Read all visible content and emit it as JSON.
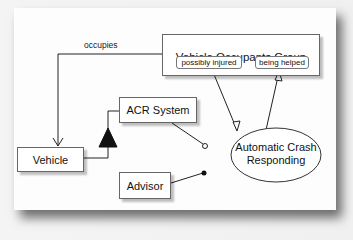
{
  "diagram": {
    "type": "uml-use-case",
    "nodes": {
      "vehicle_occupants_group": {
        "title": "Vehicle Occupants Group",
        "states": [
          "possibly injured",
          "being helped"
        ]
      },
      "acr_system": {
        "label": "ACR System"
      },
      "vehicle": {
        "label": "Vehicle"
      },
      "advisor": {
        "label": "Advisor"
      },
      "use_case": {
        "line1": "Automatic Crash",
        "line2": "Responding"
      }
    },
    "edges": [
      {
        "from": "Vehicle Occupants Group",
        "to": "Vehicle",
        "label": "occupies",
        "arrow": "open"
      },
      {
        "from": "Vehicle",
        "to": "ACR System",
        "arrow": "filled-triangle"
      },
      {
        "from": "ACR System",
        "to": "Automatic Crash Responding",
        "end": "hollow-circle"
      },
      {
        "from": "Advisor",
        "to": "Automatic Crash Responding",
        "end": "filled-circle"
      },
      {
        "from": "possibly injured",
        "to": "Automatic Crash Responding",
        "arrow": "hollow-triangle"
      },
      {
        "from": "Automatic Crash Responding",
        "to": "being helped",
        "arrow": "hollow-triangle"
      }
    ],
    "edge_labels": {
      "occupies": "occupies"
    }
  },
  "colors": {
    "line": "#222222",
    "box_border": "#666666",
    "page": "#fdfdfd"
  }
}
